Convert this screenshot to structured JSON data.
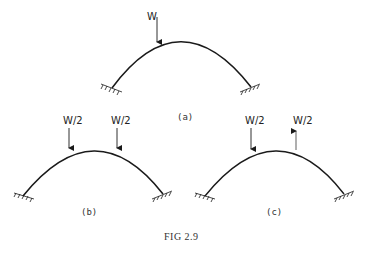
{
  "figure": {
    "caption": "FIG 2.9",
    "panels": [
      {
        "id": "a",
        "label": "(a)",
        "loads": [
          {
            "text": "W",
            "direction": "down"
          }
        ]
      },
      {
        "id": "b",
        "label": "(b)",
        "loads": [
          {
            "text": "W/2",
            "direction": "down"
          },
          {
            "text": "W/2",
            "direction": "down"
          }
        ]
      },
      {
        "id": "c",
        "label": "(c)",
        "loads": [
          {
            "text": "W/2",
            "direction": "down"
          },
          {
            "text": "W/2",
            "direction": "up"
          }
        ]
      }
    ],
    "support_type": "fixed",
    "colors": {
      "line": "#1a1a1a",
      "background": "#ffffff"
    }
  }
}
